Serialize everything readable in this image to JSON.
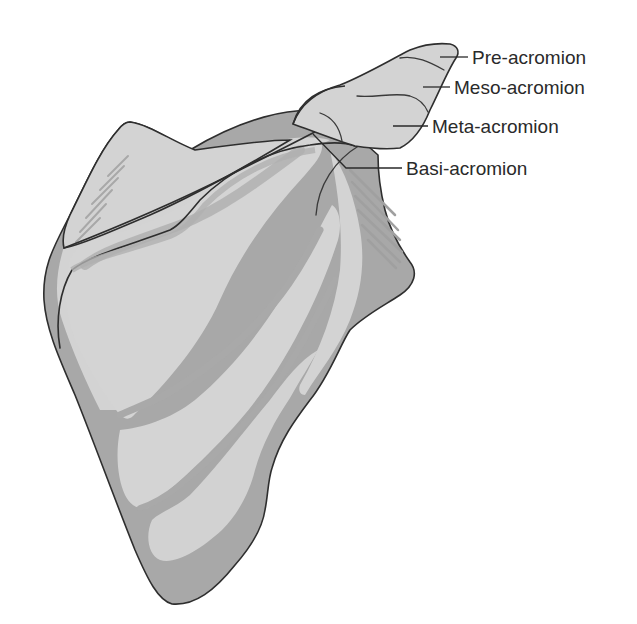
{
  "figure": {
    "colors": {
      "bone_light": "#d3d3d3",
      "bone_mid": "#bdbdbd",
      "bone_dark": "#a6a6a6",
      "outline": "#2e2e2e",
      "background": "#ffffff"
    }
  },
  "labels": [
    {
      "id": "pre",
      "text": "Pre-acromion"
    },
    {
      "id": "meso",
      "text": "Meso-acromion"
    },
    {
      "id": "meta",
      "text": "Meta-acromion"
    },
    {
      "id": "basi",
      "text": "Basi-acromion"
    }
  ]
}
